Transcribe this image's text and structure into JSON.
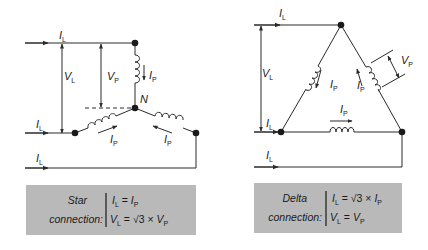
{
  "colors": {
    "line": "#2a2a2a",
    "box_fill": "#b9b9b9",
    "background": "#ffffff"
  },
  "star": {
    "labels": {
      "line_current_top": "I",
      "line_current_mid": "I",
      "line_current_bottom": "I",
      "line_sub": "L",
      "line_voltage": "V",
      "phase_voltage": "V",
      "phase_sub": "P",
      "phase_current": "I",
      "neutral": "N"
    },
    "box": {
      "title_line1": "Star",
      "title_line2": "connection:",
      "eq1_lhs": "I",
      "eq1_lhs_sub": "L",
      "eq1_op": " = ",
      "eq1_rhs": "I",
      "eq1_rhs_sub": "P",
      "eq2_lhs": "V",
      "eq2_lhs_sub": "L",
      "eq2_op": " = √3 × ",
      "eq2_rhs": "V",
      "eq2_rhs_sub": "P"
    }
  },
  "delta": {
    "labels": {
      "line_current_top": "I",
      "line_current_mid": "I",
      "line_current_bottom": "I",
      "line_sub": "L",
      "line_voltage": "V",
      "phase_voltage": "V",
      "phase_sub": "P",
      "phase_current": "I"
    },
    "box": {
      "title_line1": "Delta",
      "title_line2": "connection:",
      "eq1_lhs": "I",
      "eq1_lhs_sub": "L",
      "eq1_op": " = √3 × ",
      "eq1_rhs": "I",
      "eq1_rhs_sub": "P",
      "eq2_lhs": "V",
      "eq2_lhs_sub": "L",
      "eq2_op": " = ",
      "eq2_rhs": "V",
      "eq2_rhs_sub": "P"
    }
  }
}
